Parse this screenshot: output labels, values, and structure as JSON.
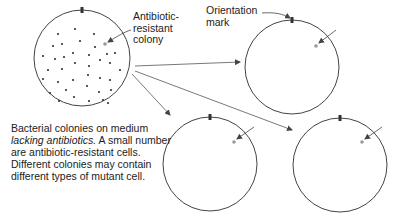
{
  "labels": {
    "antibiotic_resistant_colony_line1": "Antibiotic-",
    "antibiotic_resistant_colony_line2": "resistant",
    "antibiotic_resistant_colony_line3": "colony",
    "orientation_mark_line1": "Orientation",
    "orientation_mark_line2": "mark"
  },
  "caption": {
    "part1": "Bacterial colonies on medium",
    "italic": "lacking antibiotics.",
    "part2": " A small number are antibiotic-resistant cells. Different colonies may contain different types of mutant cell."
  },
  "colors": {
    "outline": "#444444",
    "colony": "#333333",
    "resistant_colony": "#999999",
    "arrow": "#555555"
  },
  "dishes": [
    {
      "id": "master-plate",
      "cx": 82,
      "cy": 58,
      "r": 48
    },
    {
      "id": "replica-top-right",
      "cx": 292,
      "cy": 67,
      "r": 47
    },
    {
      "id": "replica-bottom-middle",
      "cx": 210,
      "cy": 164,
      "r": 47
    },
    {
      "id": "replica-bottom-right",
      "cx": 340,
      "cy": 165,
      "r": 47
    }
  ]
}
